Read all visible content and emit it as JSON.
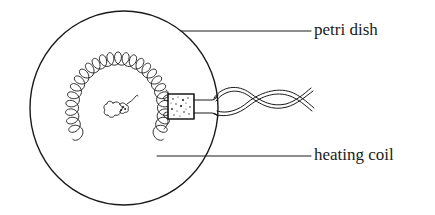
{
  "diagram": {
    "type": "labeled apparatus illustration",
    "labels": [
      {
        "id": "petri_dish",
        "text": "petri dish"
      },
      {
        "id": "heating_coil",
        "text": "heating coil"
      }
    ],
    "components": [
      "petri-dish",
      "heating-coil",
      "specimen",
      "connector-block",
      "twisted-lead-wires"
    ],
    "colors": {
      "stroke": "#1a1a1a",
      "background": "#ffffff"
    }
  }
}
